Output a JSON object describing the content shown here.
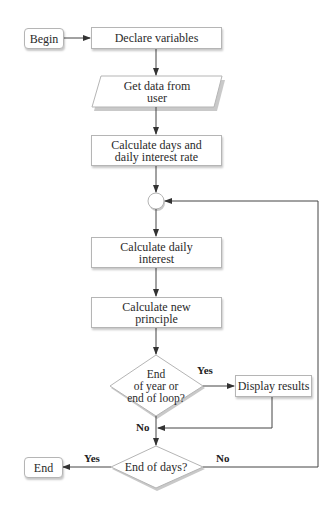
{
  "diagram": {
    "type": "flowchart",
    "nodes": {
      "begin": {
        "label": "Begin",
        "shape": "terminal"
      },
      "declare": {
        "label": "Declare variables",
        "shape": "process"
      },
      "get_data": {
        "label": "Get data from\nuser",
        "shape": "input-output"
      },
      "calc_days": {
        "label": "Calculate days and\ndaily interest rate",
        "shape": "process"
      },
      "connector": {
        "label": "",
        "shape": "connector"
      },
      "calc_interest": {
        "label": "Calculate daily\ninterest",
        "shape": "process"
      },
      "calc_principle": {
        "label": "Calculate new\nprinciple",
        "shape": "process"
      },
      "decision_year": {
        "label": "End\nof year or\nend of loop?",
        "shape": "decision"
      },
      "display": {
        "label": "Display results",
        "shape": "process"
      },
      "decision_days": {
        "label": "End of days?",
        "shape": "decision"
      },
      "end": {
        "label": "End",
        "shape": "terminal"
      }
    },
    "edges": [
      {
        "from": "begin",
        "to": "declare",
        "label": ""
      },
      {
        "from": "declare",
        "to": "get_data",
        "label": ""
      },
      {
        "from": "get_data",
        "to": "calc_days",
        "label": ""
      },
      {
        "from": "calc_days",
        "to": "connector",
        "label": ""
      },
      {
        "from": "connector",
        "to": "calc_interest",
        "label": ""
      },
      {
        "from": "calc_interest",
        "to": "calc_principle",
        "label": ""
      },
      {
        "from": "calc_principle",
        "to": "decision_year",
        "label": ""
      },
      {
        "from": "decision_year",
        "to": "display",
        "label": "Yes"
      },
      {
        "from": "decision_year",
        "to": "decision_days",
        "label": "No"
      },
      {
        "from": "display",
        "to": "decision_days",
        "label": ""
      },
      {
        "from": "decision_days",
        "to": "end",
        "label": "Yes"
      },
      {
        "from": "decision_days",
        "to": "connector",
        "label": "No"
      }
    ],
    "edge_labels": {
      "year_yes": "Yes",
      "year_no": "No",
      "days_yes": "Yes",
      "days_no": "No"
    },
    "colors": {
      "line": "#444444",
      "border": "#b5b5b5",
      "shadow": "#c8c8c8",
      "text": "#2a2a2a"
    }
  }
}
